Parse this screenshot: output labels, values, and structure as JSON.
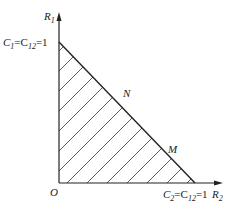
{
  "diagram": {
    "axes": {
      "y_label": "R",
      "y_label_sub": "1",
      "x_label": "R",
      "x_label_sub": "2",
      "origin_label": "O"
    },
    "intercepts": {
      "y_intercept": {
        "c": "C",
        "c_sub": "1",
        "eq": "=C",
        "eq_sub": "12",
        "val": "=1"
      },
      "x_intercept": {
        "c": "C",
        "c_sub": "2",
        "eq": "=C",
        "eq_sub": "12",
        "val": "=1"
      }
    },
    "points": [
      {
        "label": "N"
      },
      {
        "label": "M"
      }
    ],
    "region": {
      "description": "hatched capacity region under line from (0,1) to (1,0)"
    },
    "colors": {
      "line": "#222222",
      "hatch": "#333333",
      "background": "#ffffff"
    }
  }
}
